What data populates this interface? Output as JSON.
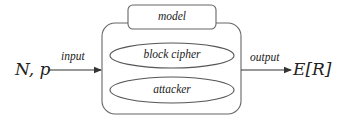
{
  "diagram": {
    "type": "block-diagram",
    "input": {
      "variables": "N, p",
      "arrow_label": "input"
    },
    "model": {
      "title": "model",
      "components": [
        {
          "label": "block cipher",
          "shape": "ellipse"
        },
        {
          "label": "attacker",
          "shape": "ellipse"
        }
      ]
    },
    "output": {
      "arrow_label": "output",
      "result": "E[R]"
    },
    "colors": {
      "stroke": "#555555",
      "text": "#222222",
      "background": "#ffffff"
    }
  }
}
